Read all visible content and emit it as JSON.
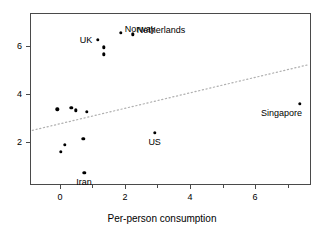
{
  "chart_data": {
    "type": "scatter",
    "title": "",
    "xlabel": "Per-person consumption",
    "ylabel": "",
    "xlim": [
      -0.92,
      7.72
    ],
    "ylim": [
      0.17,
      7.41
    ],
    "grid": false,
    "legend": null,
    "x_ticks": [
      {
        "value": 0,
        "label": "0"
      },
      {
        "value": 2,
        "label": "2"
      },
      {
        "value": 4,
        "label": "4"
      },
      {
        "value": 6,
        "label": "6"
      }
    ],
    "x_minor_ticks": [
      1,
      3,
      5,
      7
    ],
    "y_ticks": [
      {
        "value": 2,
        "label": "2"
      },
      {
        "value": 4,
        "label": "4"
      },
      {
        "value": 6,
        "label": "6"
      }
    ],
    "y_minor_ticks": [],
    "points": [
      {
        "x": 1.16,
        "y": 6.27,
        "label": "UK",
        "label_pos": "left"
      },
      {
        "x": 1.35,
        "y": 5.96,
        "label": "",
        "label_pos": ""
      },
      {
        "x": 1.35,
        "y": 5.67,
        "label": "",
        "label_pos": ""
      },
      {
        "x": 1.87,
        "y": 6.58,
        "label": "Norway",
        "label_pos": "right"
      },
      {
        "x": 2.24,
        "y": 6.51,
        "label": "Netherlands",
        "label_pos": "right"
      },
      {
        "x": -0.08,
        "y": 3.35,
        "label": "",
        "label_pos": ""
      },
      {
        "x": 0.35,
        "y": 3.43,
        "label": "",
        "label_pos": ""
      },
      {
        "x": 0.49,
        "y": 3.31,
        "label": "",
        "label_pos": ""
      },
      {
        "x": 0.83,
        "y": 3.24,
        "label": "",
        "label_pos": ""
      },
      {
        "x": 0.72,
        "y": 2.12,
        "label": "",
        "label_pos": ""
      },
      {
        "x": 0.15,
        "y": 1.87,
        "label": "",
        "label_pos": ""
      },
      {
        "x": 0.03,
        "y": 1.56,
        "label": "",
        "label_pos": ""
      },
      {
        "x": 0.75,
        "y": 0.68,
        "label": "Iran",
        "label_pos": "below"
      },
      {
        "x": 2.92,
        "y": 2.37,
        "label": "US",
        "label_pos": "below"
      },
      {
        "x": 7.38,
        "y": 3.58,
        "label": "Singapore",
        "label_pos": "belowleft"
      }
    ],
    "trendline": {
      "style": "dotted",
      "color": "#b0b0b0",
      "x_start": -0.85,
      "y_start": 2.47,
      "x_end": 7.66,
      "y_end": 5.24
    },
    "point_color": "#000000",
    "axis_color": "#4a4a4a"
  }
}
